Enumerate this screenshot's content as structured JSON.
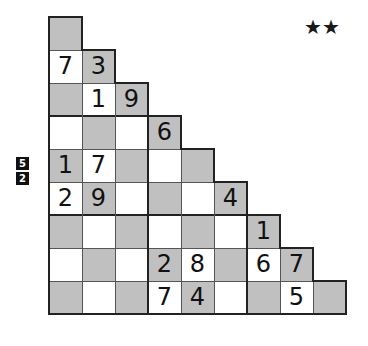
{
  "difficulty": {
    "stars": "★★",
    "count": 2
  },
  "clues": [
    "5",
    "2"
  ],
  "grid": {
    "cell_size": 33,
    "origin": [
      49,
      17
    ],
    "colors": {
      "gray": "#c0c0c0",
      "white": "#ffffff",
      "border": "#222222"
    },
    "rows": [
      [
        {
          "c": "g",
          "v": ""
        }
      ],
      [
        {
          "c": "w",
          "v": "7"
        },
        {
          "c": "g",
          "v": "3"
        }
      ],
      [
        {
          "c": "g",
          "v": ""
        },
        {
          "c": "w",
          "v": "1"
        },
        {
          "c": "g",
          "v": "9"
        }
      ],
      [
        {
          "c": "w",
          "v": ""
        },
        {
          "c": "g",
          "v": ""
        },
        {
          "c": "w",
          "v": ""
        },
        {
          "c": "g",
          "v": "6"
        }
      ],
      [
        {
          "c": "g",
          "v": "1"
        },
        {
          "c": "w",
          "v": "7"
        },
        {
          "c": "g",
          "v": ""
        },
        {
          "c": "w",
          "v": ""
        },
        {
          "c": "g",
          "v": ""
        }
      ],
      [
        {
          "c": "w",
          "v": "2"
        },
        {
          "c": "g",
          "v": "9"
        },
        {
          "c": "w",
          "v": ""
        },
        {
          "c": "g",
          "v": ""
        },
        {
          "c": "w",
          "v": ""
        },
        {
          "c": "g",
          "v": "4"
        }
      ],
      [
        {
          "c": "g",
          "v": ""
        },
        {
          "c": "w",
          "v": ""
        },
        {
          "c": "g",
          "v": ""
        },
        {
          "c": "w",
          "v": ""
        },
        {
          "c": "g",
          "v": ""
        },
        {
          "c": "w",
          "v": ""
        },
        {
          "c": "g",
          "v": "1"
        }
      ],
      [
        {
          "c": "w",
          "v": ""
        },
        {
          "c": "g",
          "v": ""
        },
        {
          "c": "w",
          "v": ""
        },
        {
          "c": "g",
          "v": "2"
        },
        {
          "c": "w",
          "v": "8"
        },
        {
          "c": "g",
          "v": ""
        },
        {
          "c": "w",
          "v": "6"
        },
        {
          "c": "g",
          "v": "7"
        }
      ],
      [
        {
          "c": "g",
          "v": ""
        },
        {
          "c": "w",
          "v": ""
        },
        {
          "c": "g",
          "v": ""
        },
        {
          "c": "w",
          "v": "7"
        },
        {
          "c": "g",
          "v": "4"
        },
        {
          "c": "w",
          "v": ""
        },
        {
          "c": "g",
          "v": ""
        },
        {
          "c": "w",
          "v": "5"
        },
        {
          "c": "g",
          "v": ""
        }
      ]
    ]
  }
}
